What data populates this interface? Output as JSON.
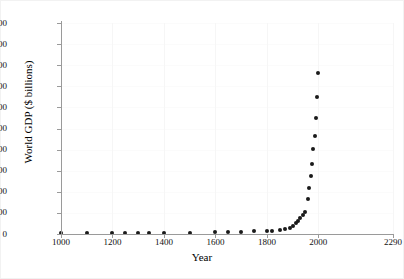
{
  "chart_data": {
    "type": "scatter",
    "title": "",
    "xlabel": "Year",
    "ylabel": "World GDP ($ billions)",
    "xlim": [
      1000,
      2290
    ],
    "ylim": [
      0,
      50000
    ],
    "grid": true,
    "legend": false,
    "marker": "filled-circle",
    "marker_color": "#1a1a1a",
    "xticks": [
      "1000",
      "1200",
      "1400",
      "1600",
      "1800",
      "2000",
      "2290"
    ],
    "xtick_values": [
      1000,
      1200,
      1400,
      1600,
      1800,
      2000,
      2290
    ],
    "yticks": [
      "0",
      "5000",
      "10000",
      "15000",
      "20000",
      "25000",
      "30000",
      "35000",
      "40000",
      "45000",
      "50000"
    ],
    "ytick_values": [
      0,
      5000,
      10000,
      15000,
      20000,
      25000,
      30000,
      35000,
      40000,
      45000,
      50000
    ],
    "x": [
      1000,
      1100,
      1200,
      1250,
      1300,
      1340,
      1400,
      1500,
      1600,
      1650,
      1700,
      1750,
      1800,
      1820,
      1850,
      1870,
      1890,
      1900,
      1913,
      1920,
      1930,
      1940,
      1950,
      1960,
      1970,
      1980,
      1990,
      1995,
      2000,
      2003
    ],
    "y": [
      120,
      140,
      180,
      200,
      220,
      230,
      250,
      300,
      400,
      450,
      500,
      600,
      700,
      750,
      900,
      1100,
      1500,
      1900,
      2700,
      3000,
      3700,
      4500,
      5300,
      8400,
      10800,
      13800,
      16700,
      20100,
      23200,
      27500
    ],
    "series": [
      {
        "name": "World GDP",
        "points": [
          {
            "year": 1000,
            "gdp": 120
          },
          {
            "year": 1100,
            "gdp": 140
          },
          {
            "year": 1200,
            "gdp": 180
          },
          {
            "year": 1250,
            "gdp": 200
          },
          {
            "year": 1300,
            "gdp": 220
          },
          {
            "year": 1340,
            "gdp": 230
          },
          {
            "year": 1400,
            "gdp": 250
          },
          {
            "year": 1500,
            "gdp": 300
          },
          {
            "year": 1600,
            "gdp": 400
          },
          {
            "year": 1650,
            "gdp": 450
          },
          {
            "year": 1700,
            "gdp": 500
          },
          {
            "year": 1750,
            "gdp": 600
          },
          {
            "year": 1800,
            "gdp": 700
          },
          {
            "year": 1820,
            "gdp": 750
          },
          {
            "year": 1850,
            "gdp": 900
          },
          {
            "year": 1870,
            "gdp": 1100
          },
          {
            "year": 1890,
            "gdp": 1500
          },
          {
            "year": 1900,
            "gdp": 1900
          },
          {
            "year": 1913,
            "gdp": 2700
          },
          {
            "year": 1920,
            "gdp": 3000
          },
          {
            "year": 1930,
            "gdp": 3700
          },
          {
            "year": 1940,
            "gdp": 4500
          },
          {
            "year": 1950,
            "gdp": 5300
          },
          {
            "year": 1960,
            "gdp": 8400
          },
          {
            "year": 1965,
            "gdp": 10800
          },
          {
            "year": 1970,
            "gdp": 13800
          },
          {
            "year": 1975,
            "gdp": 16700
          },
          {
            "year": 1980,
            "gdp": 20100
          },
          {
            "year": 1985,
            "gdp": 23200
          },
          {
            "year": 1990,
            "gdp": 27500
          },
          {
            "year": 1995,
            "gdp": 32500
          },
          {
            "year": 2000,
            "gdp": 38200
          }
        ]
      }
    ]
  }
}
